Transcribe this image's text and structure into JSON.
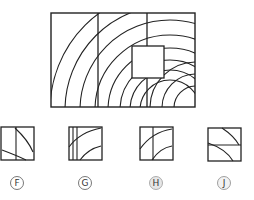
{
  "figure": {
    "main_rect": {
      "x": 51,
      "y": 13,
      "w": 144,
      "h": 94
    },
    "dividers_x": [
      98,
      147
    ],
    "missing_square": {
      "x": 132,
      "y": 46,
      "w": 32,
      "h": 32
    },
    "stroke": "#222222"
  },
  "options": [
    {
      "letter": "F",
      "x": 1,
      "y": 127,
      "cx": 17,
      "cy": 183
    },
    {
      "letter": "G",
      "x": 69,
      "y": 127,
      "cx": 85,
      "cy": 183
    },
    {
      "letter": "H",
      "x": 140,
      "y": 127,
      "cx": 156,
      "cy": 183
    },
    {
      "letter": "J",
      "x": 208,
      "y": 128,
      "cx": 224,
      "cy": 183
    }
  ]
}
